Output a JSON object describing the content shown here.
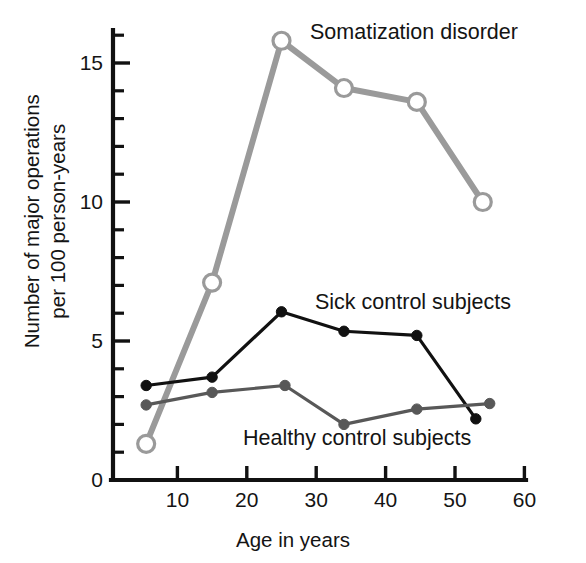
{
  "chart_data": {
    "type": "line",
    "title": "",
    "xlabel": "Age in years",
    "ylabel": "Number of major operations per 100 person-years",
    "ylabel_line1": "Number of major operations",
    "ylabel_line2": "per 100 person-years",
    "xlim": [
      0,
      60
    ],
    "ylim": [
      0,
      16.6
    ],
    "grid": false,
    "legend_position": "inline-annotations",
    "x_ticks": [
      10,
      20,
      30,
      40,
      50,
      60
    ],
    "x_tick_labels": [
      "10",
      "20",
      "30",
      "40",
      "50",
      "60"
    ],
    "y_ticks": [
      0,
      5,
      10,
      15
    ],
    "y_tick_labels": [
      "0",
      "5",
      "10",
      "15"
    ],
    "y_minor_ticks": [
      1,
      2,
      3,
      4,
      6,
      7,
      8,
      9,
      11,
      12,
      13,
      14,
      16
    ],
    "series": [
      {
        "name": "Somatization disorder",
        "color": "#9a9a9a",
        "marker": "open-circle",
        "marker_fill": "#ffffff",
        "line_width": 6,
        "points": [
          {
            "x": 5.5,
            "y": 1.3
          },
          {
            "x": 15.0,
            "y": 7.1
          },
          {
            "x": 25.0,
            "y": 15.8
          },
          {
            "x": 34.0,
            "y": 14.1
          },
          {
            "x": 44.5,
            "y": 13.6
          },
          {
            "x": 54.0,
            "y": 10.0
          }
        ]
      },
      {
        "name": "Sick control subjects",
        "color": "#111111",
        "marker": "filled-circle",
        "marker_fill": "#111111",
        "line_width": 3.2,
        "points": [
          {
            "x": 5.5,
            "y": 3.4
          },
          {
            "x": 15.0,
            "y": 3.7
          },
          {
            "x": 25.0,
            "y": 6.05
          },
          {
            "x": 34.0,
            "y": 5.35
          },
          {
            "x": 44.5,
            "y": 5.2
          },
          {
            "x": 53.0,
            "y": 2.2
          }
        ]
      },
      {
        "name": "Healthy control subjects",
        "color": "#585858",
        "marker": "filled-circle",
        "marker_fill": "#585858",
        "line_width": 3.2,
        "points": [
          {
            "x": 5.5,
            "y": 2.7
          },
          {
            "x": 15.0,
            "y": 3.15
          },
          {
            "x": 25.5,
            "y": 3.4
          },
          {
            "x": 34.0,
            "y": 2.0
          },
          {
            "x": 44.5,
            "y": 2.55
          },
          {
            "x": 55.0,
            "y": 2.75
          }
        ]
      }
    ],
    "annotations": [
      {
        "text": "Somatization disorder",
        "x": 60,
        "y": 15.7
      },
      {
        "text": "Sick control subjects",
        "x": 34.5,
        "y": 6.55
      },
      {
        "text": "Healthy control subjects",
        "x": 24.0,
        "y": 1.35
      }
    ]
  }
}
